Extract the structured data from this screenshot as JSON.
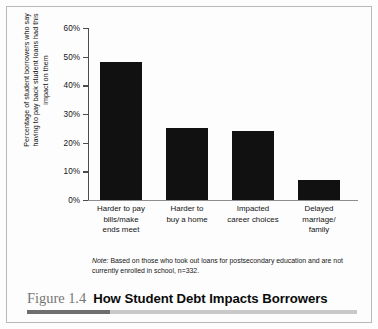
{
  "figure": {
    "number_label": "Figure 1.4",
    "title": "How Student Debt Impacts Borrowers",
    "note_lead": "Note:",
    "note_body": " Based on those who took out loans for postsecondary education and are not currently enrolled in school, n=332.",
    "accent_color": "#6e6e6e",
    "rule_color": "#c9c9c9",
    "figno_color": "#767676"
  },
  "chart_data": {
    "type": "bar",
    "title": "How Student Debt Impacts Borrowers",
    "xlabel": "",
    "ylabel": "Percentage of student borrowers who say having to pay back student loans had this impact on them",
    "categories": [
      "Harder to pay bills/make ends meet",
      "Harder to buy a home",
      "Impacted career choices",
      "Delayed marriage/ family"
    ],
    "category_lines": [
      [
        "Harder to pay",
        "bills/make",
        "ends meet"
      ],
      [
        "Harder to",
        "buy a home"
      ],
      [
        "Impacted",
        "career choices"
      ],
      [
        "Delayed",
        "marriage/",
        "family"
      ]
    ],
    "values": [
      48,
      25,
      24,
      7
    ],
    "value_labels": [
      "48%",
      "25%",
      "24%",
      "7%"
    ],
    "ylim": [
      0,
      60
    ],
    "ytick_values": [
      0,
      10,
      20,
      30,
      40,
      50,
      60
    ],
    "ytick_labels": [
      "0%",
      "10%",
      "20%",
      "30%",
      "40%",
      "50%",
      "60%"
    ],
    "grid": false,
    "legend": "none",
    "bar_color": "#111111",
    "axis_color": "#4c4c4c",
    "baseline_color": "#8d8d8d"
  },
  "axis_title_lines": [
    "Percentage of student borrowers who say",
    "having to pay back student loans had this",
    "impact on them"
  ]
}
